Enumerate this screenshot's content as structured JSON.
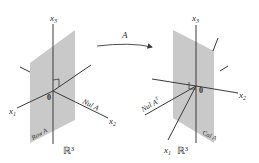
{
  "figure": {
    "mapping_label": "A",
    "colors": {
      "plane": "#c9c9c9",
      "axis": "#3a3a3a",
      "text": "#2a2a2a",
      "background": "#ffffff"
    },
    "left_space": {
      "space_label": "ℝ³",
      "axes": {
        "x1": "x",
        "x1_sub": "1",
        "x2": "x",
        "x2_sub": "2",
        "x3": "x",
        "x3_sub": "3"
      },
      "origin_label": "0",
      "plane_label": "Row A",
      "line_label": "Nul A"
    },
    "right_space": {
      "space_label": "ℝ³",
      "axes": {
        "x1": "x",
        "x1_sub": "1",
        "x2": "x",
        "x2_sub": "2",
        "x3": "x",
        "x3_sub": "3"
      },
      "origin_label": "0",
      "plane_label": "Col A",
      "line_label": "Nul A",
      "line_label_sup": "T"
    }
  }
}
